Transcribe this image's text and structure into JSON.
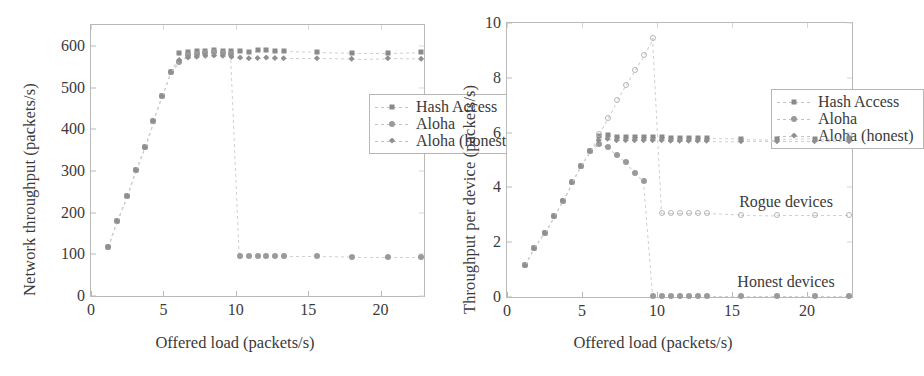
{
  "figure": {
    "panels": [
      "network-throughput",
      "throughput-per-device"
    ]
  },
  "chart_data": [
    {
      "id": "network-throughput",
      "type": "scatter",
      "title": "",
      "xlabel": "Offered load (packets/s)",
      "ylabel": "Network throughput (packets/s)",
      "xlim": [
        0,
        23
      ],
      "ylim": [
        0,
        650
      ],
      "xticks": [
        0,
        5,
        10,
        15,
        20
      ],
      "yticks": [
        0,
        100,
        200,
        300,
        400,
        500,
        600
      ],
      "grid": false,
      "legend_position": "upper-right-inside",
      "legend": [
        "Hash Access",
        "Aloha",
        "Aloha (honest)"
      ],
      "series": [
        {
          "name": "Hash Access",
          "marker": "square",
          "x": [
            1.2,
            1.8,
            2.5,
            3.1,
            3.7,
            4.3,
            4.9,
            5.5,
            6.1,
            6.7,
            7.3,
            7.9,
            8.5,
            9.1,
            9.7,
            10.3,
            10.9,
            11.5,
            12.1,
            12.7,
            13.3,
            15.6,
            18.0,
            20.5,
            22.8
          ],
          "y": [
            118,
            180,
            240,
            302,
            357,
            420,
            480,
            537,
            582,
            585,
            587,
            588,
            590,
            588,
            587,
            588,
            586,
            589,
            591,
            588,
            587,
            585,
            583,
            583,
            585
          ]
        },
        {
          "name": "Aloha",
          "marker": "circle",
          "x": [
            1.2,
            1.8,
            2.5,
            3.1,
            3.7,
            4.3,
            4.9,
            5.5,
            6.1,
            6.7,
            7.3,
            7.9,
            8.5,
            9.1,
            9.7,
            10.3,
            10.9,
            11.5,
            12.1,
            12.7,
            13.3,
            15.6,
            18.0,
            20.5,
            22.8
          ],
          "y": [
            118,
            180,
            240,
            302,
            357,
            420,
            480,
            537,
            562,
            578,
            581,
            584,
            586,
            583,
            581,
            95,
            95,
            96,
            96,
            95,
            95,
            95,
            94,
            94,
            94
          ]
        },
        {
          "name": "Aloha (honest)",
          "marker": "diamond",
          "x": [
            1.2,
            1.8,
            2.5,
            3.1,
            3.7,
            4.3,
            4.9,
            5.5,
            6.1,
            6.7,
            7.3,
            7.9,
            8.5,
            9.1,
            9.7,
            10.3,
            10.9,
            11.5,
            12.1,
            12.7,
            13.3,
            15.6,
            18.0,
            20.5,
            22.8
          ],
          "y": [
            118,
            180,
            240,
            302,
            357,
            420,
            480,
            537,
            566,
            572,
            574,
            576,
            577,
            576,
            574,
            572,
            570,
            571,
            572,
            571,
            570,
            570,
            569,
            570,
            569
          ]
        }
      ]
    },
    {
      "id": "throughput-per-device",
      "type": "scatter",
      "title": "",
      "xlabel": "Offered load (packets/s)",
      "ylabel": "Throughput per device (packets/s)",
      "xlim": [
        0,
        23
      ],
      "ylim": [
        0,
        10
      ],
      "xticks": [
        0,
        5,
        10,
        15,
        20
      ],
      "yticks": [
        0,
        2,
        4,
        6,
        8,
        10
      ],
      "grid": false,
      "legend_position": "upper-right-inside",
      "legend": [
        "Hash Access",
        "Aloha",
        "Aloha (honest)"
      ],
      "annotations": [
        {
          "text": "Rogue devices",
          "x": 18.6,
          "y": 3.45
        },
        {
          "text": "Honest devices",
          "x": 18.6,
          "y": 0.55
        }
      ],
      "series": [
        {
          "name": "Hash Access",
          "marker": "square",
          "x": [
            1.2,
            1.8,
            2.5,
            3.1,
            3.7,
            4.3,
            4.9,
            5.5,
            6.1,
            6.7,
            7.3,
            7.9,
            8.5,
            9.1,
            9.7,
            10.3,
            10.9,
            11.5,
            12.1,
            12.7,
            13.3,
            15.6,
            18.0,
            20.5,
            22.8
          ],
          "y": [
            1.15,
            1.78,
            2.35,
            2.95,
            3.52,
            4.18,
            4.78,
            5.33,
            5.88,
            5.9,
            5.85,
            5.85,
            5.85,
            5.85,
            5.85,
            5.85,
            5.8,
            5.8,
            5.8,
            5.8,
            5.8,
            5.78,
            5.75,
            5.78,
            5.8
          ]
        },
        {
          "name": "Aloha (rogue)",
          "marker": "circle-open",
          "x": [
            6.1,
            6.7,
            7.3,
            7.9,
            8.5,
            9.1,
            9.7,
            10.3,
            10.9,
            11.5,
            12.1,
            12.7,
            13.3,
            15.6,
            18.0,
            20.5,
            22.8
          ],
          "y": [
            5.95,
            6.55,
            7.18,
            7.75,
            8.3,
            8.85,
            9.45,
            3.05,
            3.05,
            3.05,
            3.05,
            3.05,
            3.05,
            3.0,
            2.98,
            2.98,
            2.98
          ]
        },
        {
          "name": "Aloha",
          "marker": "circle",
          "x": [
            1.2,
            1.8,
            2.5,
            3.1,
            3.7,
            4.3,
            4.9,
            5.5,
            6.1,
            6.7,
            7.3,
            7.9,
            8.5,
            9.1,
            9.7,
            10.3,
            10.9,
            11.5,
            12.1,
            12.7,
            13.3,
            15.6,
            18.0,
            20.5,
            22.8
          ],
          "y": [
            1.15,
            1.78,
            2.35,
            2.95,
            3.52,
            4.18,
            4.78,
            5.33,
            5.6,
            5.48,
            5.18,
            4.92,
            4.52,
            4.22,
            0.05,
            0.05,
            0.05,
            0.05,
            0.05,
            0.05,
            0.05,
            0.05,
            0.05,
            0.05,
            0.05
          ]
        },
        {
          "name": "Aloha (honest)",
          "marker": "diamond",
          "x": [
            1.2,
            1.8,
            2.5,
            3.1,
            3.7,
            4.3,
            4.9,
            5.5,
            6.1,
            6.7,
            7.3,
            7.9,
            8.5,
            9.1,
            9.7,
            10.3,
            10.9,
            11.5,
            12.1,
            12.7,
            13.3,
            15.6,
            18.0,
            20.5,
            22.8
          ],
          "y": [
            1.15,
            1.78,
            2.35,
            2.95,
            3.52,
            4.18,
            4.78,
            5.33,
            5.72,
            5.78,
            5.72,
            5.72,
            5.72,
            5.72,
            5.72,
            5.72,
            5.7,
            5.7,
            5.7,
            5.7,
            5.7,
            5.68,
            5.68,
            5.68,
            5.68
          ]
        }
      ]
    }
  ]
}
